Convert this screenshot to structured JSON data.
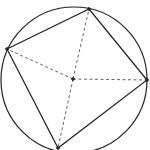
{
  "diagram": {
    "type": "inscribed-quadrilateral",
    "stroke_color": "#222222",
    "dash_color": "#555555",
    "background": "#ffffff",
    "circle": {
      "cx": 74,
      "cy": 80,
      "r": 73
    },
    "center": {
      "x": 73,
      "y": 79
    },
    "vertices": [
      {
        "name": "top",
        "x": 89,
        "y": 9
      },
      {
        "name": "right",
        "x": 147,
        "y": 80
      },
      {
        "name": "bottom",
        "x": 58,
        "y": 148
      },
      {
        "name": "left",
        "x": 7,
        "y": 49
      }
    ]
  }
}
